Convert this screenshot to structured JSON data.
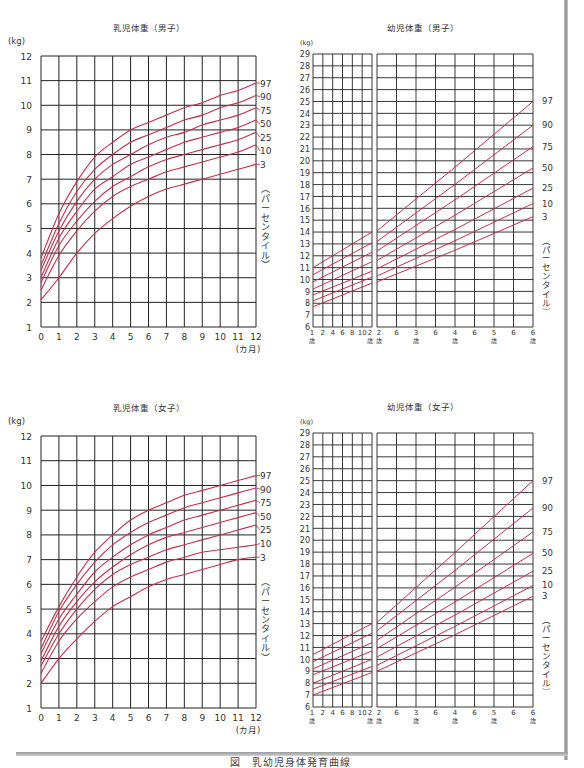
{
  "page": {
    "caption": "図　乳幼児身体発育曲線"
  },
  "labels": {
    "kg_unit": "(kg)",
    "months_unit": "(カ月)",
    "percentile_axis": "(パーセンタイル)",
    "year_suffix": "歳"
  },
  "colors": {
    "curve": "#c0304a",
    "grid": "#222222",
    "text": "#333333"
  },
  "chart_data": [
    {
      "id": "infant-boys",
      "type": "line",
      "title": "乳児体重（男子）",
      "xlabel": "(カ月)",
      "ylabel": "(kg)",
      "x": [
        0,
        1,
        2,
        3,
        4,
        5,
        6,
        7,
        8,
        9,
        10,
        11,
        12
      ],
      "xticks": [
        "0",
        "1",
        "2",
        "3",
        "4",
        "5",
        "6",
        "7",
        "8",
        "9",
        "10",
        "11",
        "12"
      ],
      "ylim": [
        1,
        12
      ],
      "yticks": [
        1,
        2,
        3,
        4,
        5,
        6,
        7,
        8,
        9,
        10,
        11,
        12
      ],
      "grid": true,
      "legend_position": "right",
      "legend_title": "(パーセンタイル)",
      "series": [
        {
          "name": "97",
          "values": [
            3.8,
            5.6,
            6.9,
            7.9,
            8.5,
            9.0,
            9.3,
            9.6,
            9.9,
            10.1,
            10.4,
            10.6,
            10.9
          ]
        },
        {
          "name": "90",
          "values": [
            3.5,
            5.2,
            6.5,
            7.4,
            8.0,
            8.5,
            8.8,
            9.1,
            9.4,
            9.6,
            9.9,
            10.1,
            10.4
          ]
        },
        {
          "name": "75",
          "values": [
            3.3,
            4.9,
            6.1,
            7.0,
            7.6,
            8.0,
            8.4,
            8.7,
            8.9,
            9.2,
            9.4,
            9.6,
            9.9
          ]
        },
        {
          "name": "50",
          "values": [
            3.0,
            4.6,
            5.7,
            6.6,
            7.1,
            7.6,
            7.9,
            8.2,
            8.5,
            8.7,
            8.9,
            9.1,
            9.4
          ]
        },
        {
          "name": "25",
          "values": [
            2.8,
            4.3,
            5.3,
            6.1,
            6.7,
            7.1,
            7.5,
            7.8,
            8.0,
            8.2,
            8.4,
            8.6,
            8.9
          ]
        },
        {
          "name": "10",
          "values": [
            2.5,
            3.9,
            4.9,
            5.7,
            6.3,
            6.7,
            7.0,
            7.3,
            7.5,
            7.7,
            7.9,
            8.1,
            8.4
          ]
        },
        {
          "name": "3",
          "values": [
            2.1,
            3.0,
            4.0,
            4.8,
            5.4,
            5.9,
            6.3,
            6.6,
            6.8,
            7.0,
            7.2,
            7.4,
            7.6
          ]
        }
      ]
    },
    {
      "id": "toddler-boys",
      "type": "line",
      "title": "幼児体重（男子）",
      "xlabel": "",
      "ylabel": "(kg)",
      "x_left_panel": {
        "range_years": [
          1,
          2
        ],
        "ticks": [
          "1\n歳",
          "2",
          "4",
          "6",
          "8",
          "10",
          "2\n歳"
        ]
      },
      "x_right_panel": {
        "range_years": [
          2,
          6
        ],
        "ticks": [
          "2\n歳",
          "6",
          "3\n歳",
          "6",
          "4\n歳",
          "6",
          "5\n歳",
          "6",
          "6\n歳"
        ]
      },
      "ylim": [
        6,
        29
      ],
      "yticks": [
        6,
        7,
        8,
        9,
        10,
        11,
        12,
        13,
        14,
        15,
        16,
        17,
        18,
        19,
        20,
        21,
        22,
        23,
        24,
        25,
        26,
        27,
        28,
        29
      ],
      "grid": true,
      "legend_position": "right",
      "legend_title": "(パーセンタイル)",
      "series": [
        {
          "name": "97",
          "left": [
            11.0,
            14.0
          ],
          "right": [
            14.1,
            25.0
          ]
        },
        {
          "name": "90",
          "left": [
            10.4,
            13.1
          ],
          "right": [
            13.2,
            23.0
          ]
        },
        {
          "name": "75",
          "left": [
            9.8,
            12.3
          ],
          "right": [
            12.4,
            21.2
          ]
        },
        {
          "name": "50",
          "left": [
            9.2,
            11.5
          ],
          "right": [
            11.6,
            19.4
          ]
        },
        {
          "name": "25",
          "left": [
            8.7,
            10.7
          ],
          "right": [
            10.9,
            17.7
          ]
        },
        {
          "name": "10",
          "left": [
            8.2,
            10.2
          ],
          "right": [
            10.3,
            16.4
          ]
        },
        {
          "name": "3",
          "left": [
            7.7,
            9.7
          ],
          "right": [
            9.8,
            15.3
          ]
        }
      ]
    },
    {
      "id": "infant-girls",
      "type": "line",
      "title": "乳児体重（女子）",
      "xlabel": "(カ月)",
      "ylabel": "(kg)",
      "x": [
        0,
        1,
        2,
        3,
        4,
        5,
        6,
        7,
        8,
        9,
        10,
        11,
        12
      ],
      "xticks": [
        "0",
        "1",
        "2",
        "3",
        "4",
        "5",
        "6",
        "7",
        "8",
        "9",
        "10",
        "11",
        "12"
      ],
      "ylim": [
        1,
        12
      ],
      "yticks": [
        1,
        2,
        3,
        4,
        5,
        6,
        7,
        8,
        9,
        10,
        11,
        12
      ],
      "grid": true,
      "legend_position": "right",
      "legend_title": "(パーセンタイル)",
      "series": [
        {
          "name": "97",
          "values": [
            3.7,
            5.1,
            6.3,
            7.3,
            8.0,
            8.6,
            9.0,
            9.3,
            9.6,
            9.8,
            10.0,
            10.2,
            10.4
          ]
        },
        {
          "name": "90",
          "values": [
            3.4,
            4.9,
            6.0,
            6.9,
            7.6,
            8.1,
            8.5,
            8.8,
            9.1,
            9.3,
            9.5,
            9.7,
            9.9
          ]
        },
        {
          "name": "75",
          "values": [
            3.2,
            4.6,
            5.6,
            6.5,
            7.1,
            7.6,
            8.0,
            8.3,
            8.6,
            8.8,
            9.0,
            9.2,
            9.4
          ]
        },
        {
          "name": "50",
          "values": [
            2.9,
            4.3,
            5.3,
            6.1,
            6.7,
            7.2,
            7.6,
            7.9,
            8.1,
            8.3,
            8.5,
            8.7,
            8.9
          ]
        },
        {
          "name": "25",
          "values": [
            2.7,
            4.0,
            5.0,
            5.8,
            6.4,
            6.8,
            7.1,
            7.4,
            7.6,
            7.8,
            8.0,
            8.2,
            8.4
          ]
        },
        {
          "name": "10",
          "values": [
            2.4,
            3.7,
            4.6,
            5.3,
            5.9,
            6.3,
            6.6,
            6.9,
            7.1,
            7.3,
            7.4,
            7.5,
            7.6
          ]
        },
        {
          "name": "3",
          "values": [
            2.0,
            3.0,
            3.8,
            4.5,
            5.1,
            5.5,
            5.9,
            6.2,
            6.4,
            6.6,
            6.8,
            7.0,
            7.1
          ]
        }
      ]
    },
    {
      "id": "toddler-girls",
      "type": "line",
      "title": "幼児体重（女子）",
      "xlabel": "",
      "ylabel": "(kg)",
      "x_left_panel": {
        "range_years": [
          1,
          2
        ],
        "ticks": [
          "1\n歳",
          "2",
          "4",
          "6",
          "8",
          "10",
          "2\n歳"
        ]
      },
      "x_right_panel": {
        "range_years": [
          2,
          6
        ],
        "ticks": [
          "2\n歳",
          "6",
          "3\n歳",
          "6",
          "4\n歳",
          "6",
          "5\n歳",
          "6",
          "6\n歳"
        ]
      },
      "ylim": [
        6,
        29
      ],
      "yticks": [
        6,
        7,
        8,
        9,
        10,
        11,
        12,
        13,
        14,
        15,
        16,
        17,
        18,
        19,
        20,
        21,
        22,
        23,
        24,
        25,
        26,
        27,
        28,
        29
      ],
      "grid": true,
      "legend_position": "right",
      "legend_title": "(パーセンタイル)",
      "series": [
        {
          "name": "97",
          "left": [
            10.4,
            13.0
          ],
          "right": [
            13.1,
            25.0
          ]
        },
        {
          "name": "90",
          "left": [
            9.8,
            12.2
          ],
          "right": [
            12.4,
            22.7
          ]
        },
        {
          "name": "75",
          "left": [
            9.2,
            11.4
          ],
          "right": [
            11.6,
            20.7
          ]
        },
        {
          "name": "50",
          "left": [
            8.7,
            10.7
          ],
          "right": [
            10.9,
            18.9
          ]
        },
        {
          "name": "25",
          "left": [
            8.0,
            10.0
          ],
          "right": [
            10.2,
            17.4
          ]
        },
        {
          "name": "10",
          "left": [
            7.5,
            9.4
          ],
          "right": [
            9.5,
            16.2
          ]
        },
        {
          "name": "3",
          "left": [
            7.0,
            8.9
          ],
          "right": [
            9.0,
            15.3
          ]
        }
      ]
    }
  ]
}
